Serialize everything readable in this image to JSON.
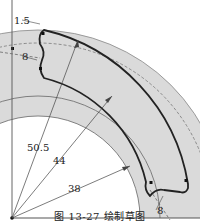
{
  "figure": {
    "caption": "图 13-27  绘制草图",
    "dimensions": [
      {
        "id": "r_outer_sketch",
        "label": "50.5"
      },
      {
        "id": "r_mid",
        "label": "44"
      },
      {
        "id": "r_inner",
        "label": "38"
      },
      {
        "id": "fillet_top",
        "label": "1.5"
      },
      {
        "id": "offset_top",
        "label": "8"
      },
      {
        "id": "offset_bottom",
        "label": "8"
      }
    ],
    "colors": {
      "fill_gray": "#d9d9d9",
      "line_dark": "#222222",
      "line_thin": "#555555"
    }
  }
}
